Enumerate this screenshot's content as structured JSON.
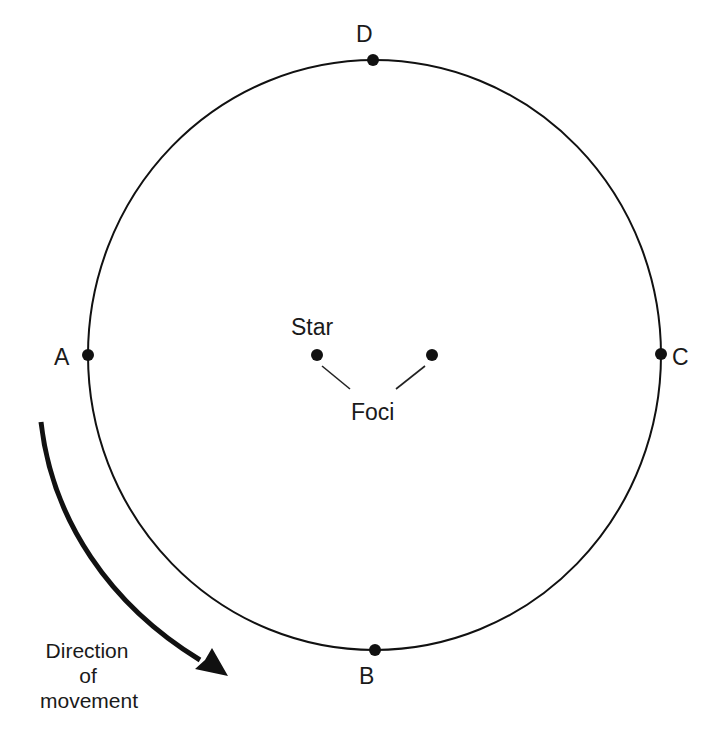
{
  "diagram": {
    "type": "elliptical-orbit",
    "colors": {
      "stroke": "#111111",
      "text": "#1a1a1a",
      "background": "#ffffff"
    },
    "orbit": {
      "cx": 374.5,
      "cy": 355,
      "rx": 286.5,
      "ry": 295
    },
    "points": [
      {
        "id": "A",
        "label": "A",
        "x": 88,
        "y": 355
      },
      {
        "id": "B",
        "label": "B",
        "x": 375,
        "y": 650
      },
      {
        "id": "C",
        "label": "C",
        "x": 661,
        "y": 354
      },
      {
        "id": "D",
        "label": "D",
        "x": 373,
        "y": 60
      }
    ],
    "foci": [
      {
        "id": "star-focus",
        "x": 317,
        "y": 355
      },
      {
        "id": "empty-focus",
        "x": 432,
        "y": 355
      }
    ],
    "labels": {
      "star": "Star",
      "foci": "Foci",
      "direction_line1": "Direction",
      "direction_line2": "of",
      "direction_line3": "movement"
    }
  }
}
